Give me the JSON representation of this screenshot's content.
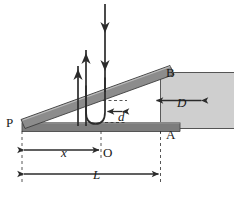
{
  "figure": {
    "type": "physics-diagram",
    "labels": {
      "P": "P",
      "O": "O",
      "A": "A",
      "B": "B",
      "D": "D",
      "d": "d",
      "x": "x",
      "L": "L"
    },
    "colors": {
      "bar_fill": "#8c8c8c",
      "bar_stroke": "#3d3d3d",
      "base_fill": "#7d7d7d",
      "block_fill": "#cfcfcf",
      "block_stroke": "#6b6b6b",
      "ink": "#2b2b2b",
      "background": "#ffffff"
    },
    "elements": {
      "inclined_bar": "inclined-bar",
      "base_bar": "base-bar",
      "block": "right-block",
      "ray_down": "incident-ray-arrow",
      "ray_up_inner": "reflected-ray-inner-arrow",
      "ray_up_outer": "reflected-ray-outer-arrow",
      "u_turn": "u-turn-path",
      "dim_d": "dimension-d",
      "dim_D": "dimension-D",
      "dim_x": "dimension-x",
      "dim_L": "dimension-L"
    }
  }
}
